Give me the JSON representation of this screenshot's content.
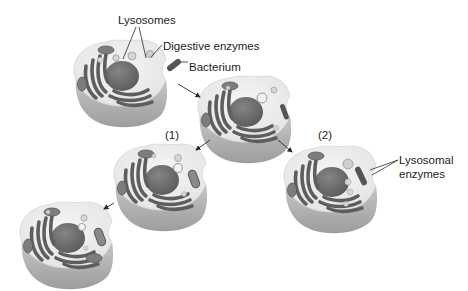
{
  "diagram": {
    "colors": {
      "background": "#ffffff",
      "cytoplasm_top": "#ededed",
      "cell_side": "#b9b9b9",
      "cell_side_dark": "#9a9a9a",
      "nucleus": "#6c6c6c",
      "er": "#5e5e5e",
      "mitochondrion": "#7d7d7d",
      "bacterium": "#555555",
      "lysosome": "#d6d6d6",
      "text": "#1e1e1e",
      "arrow": "#2a2a2a"
    },
    "labels": {
      "lysosomes": "Lysosomes",
      "digestive_enzymes": "Digestive enzymes",
      "bacterium": "Bacterium",
      "step1": "(1)",
      "step2": "(2)",
      "lysosomal_enzymes_line1": "Lysosomal",
      "lysosomal_enzymes_line2": "enzymes"
    },
    "cells": [
      {
        "id": "cell-initial",
        "stage": "Cell with lysosomes, bacterium outside"
      },
      {
        "id": "cell-engulfing",
        "stage": "Bacterium engulfed at membrane"
      },
      {
        "id": "cell-step1",
        "stage": "(1) Bacterium in vesicle, lysosome approaching"
      },
      {
        "id": "cell-final",
        "stage": "Bacterium being digested"
      },
      {
        "id": "cell-step2",
        "stage": "(2) Lysosomal enzymes act on bacterium"
      }
    ],
    "arrows": [
      {
        "from": "bacterium",
        "to": "cell-engulfing"
      },
      {
        "from": "cell-engulfing",
        "to": "cell-step1"
      },
      {
        "from": "cell-engulfing",
        "to": "cell-step2"
      },
      {
        "from": "cell-step1",
        "to": "cell-final"
      }
    ]
  }
}
